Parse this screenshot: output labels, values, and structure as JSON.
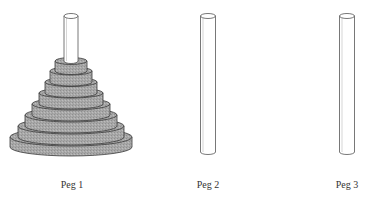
{
  "diagram": {
    "colors": {
      "disk_fill": "#a9a9a9",
      "disk_stroke": "#3a3a3a",
      "peg_fill": "#ffffff",
      "peg_stroke": "#555555"
    },
    "pegs": [
      {
        "id": 1,
        "label": "Peg 1",
        "cx": 71,
        "top": 16,
        "bottom": 152,
        "width": 14,
        "disk_count": 8
      },
      {
        "id": 2,
        "label": "Peg 2",
        "cx": 208,
        "top": 16,
        "bottom": 152,
        "width": 15,
        "disk_count": 0
      },
      {
        "id": 3,
        "label": "Peg 3",
        "cx": 347,
        "top": 16,
        "bottom": 152,
        "width": 15,
        "disk_count": 0
      }
    ],
    "disks": [
      {
        "size": 8,
        "peg": 1,
        "rx": 61,
        "ry": 9,
        "cy_top": 137,
        "thickness": 10
      },
      {
        "size": 7,
        "peg": 1,
        "rx": 53,
        "ry": 8,
        "cy_top": 126,
        "thickness": 11
      },
      {
        "size": 6,
        "peg": 1,
        "rx": 46,
        "ry": 7,
        "cy_top": 115,
        "thickness": 11
      },
      {
        "size": 5,
        "peg": 1,
        "rx": 39,
        "ry": 6,
        "cy_top": 104,
        "thickness": 11
      },
      {
        "size": 4,
        "peg": 1,
        "rx": 32,
        "ry": 5,
        "cy_top": 93,
        "thickness": 11
      },
      {
        "size": 3,
        "peg": 1,
        "rx": 26,
        "ry": 4.5,
        "cy_top": 82,
        "thickness": 11
      },
      {
        "size": 2,
        "peg": 1,
        "rx": 21,
        "ry": 4,
        "cy_top": 71,
        "thickness": 11
      },
      {
        "size": 1,
        "peg": 1,
        "rx": 16,
        "ry": 3.5,
        "cy_top": 61,
        "thickness": 10
      }
    ]
  }
}
